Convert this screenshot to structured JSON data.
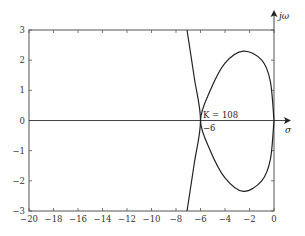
{
  "chart_data": {
    "type": "line",
    "title": "",
    "subtitle": "",
    "xlabel": "σ",
    "ylabel": "jω",
    "xlim": [
      -20,
      0
    ],
    "ylim": [
      -3,
      3
    ],
    "grid": false,
    "legend": null,
    "x_ticks": [
      -20,
      -18,
      -16,
      -14,
      -12,
      -10,
      -8,
      -6,
      -4,
      -2,
      0
    ],
    "x_tick_labels": [
      "−20",
      "−18",
      "−16",
      "−14",
      "−12",
      "−10",
      "−8",
      "−6",
      "−4",
      "−2",
      "0"
    ],
    "y_ticks": [
      3,
      2,
      1,
      0,
      -1,
      -2,
      -3
    ],
    "y_tick_labels": [
      "3",
      "2",
      "1",
      "0",
      "−1",
      "−2",
      "−3"
    ],
    "series": [
      {
        "name": "closed branch (loop)",
        "points": [
          [
            0,
            0
          ],
          [
            -0.3,
            1.3
          ],
          [
            -1.0,
            2.0
          ],
          [
            -2.5,
            2.3
          ],
          [
            -4.0,
            1.9
          ],
          [
            -5.2,
            1.0
          ],
          [
            -6,
            0
          ],
          [
            -5.2,
            -1.0
          ],
          [
            -4.0,
            -1.9
          ],
          [
            -2.5,
            -2.35
          ],
          [
            -1.0,
            -2.0
          ],
          [
            -0.3,
            -1.3
          ],
          [
            0,
            0
          ]
        ]
      },
      {
        "name": "near-vertical branch",
        "points": [
          [
            -7.1,
            3
          ],
          [
            -6.5,
            1.4
          ],
          [
            -6,
            0
          ],
          [
            -6.5,
            -1.4
          ],
          [
            -7.1,
            -3
          ]
        ]
      }
    ],
    "annotations": [
      {
        "text": "K = 108",
        "x": -5.8,
        "y": 0.1
      },
      {
        "text": "−6",
        "x": -5.8,
        "y": -0.3
      }
    ]
  },
  "labels": {
    "x_axis": "σ",
    "y_axis": "jω",
    "annotation_k": "K = 108",
    "annotation_breakaway": "−6"
  }
}
